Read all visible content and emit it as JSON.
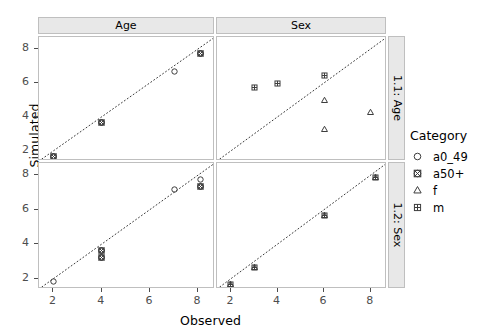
{
  "chart_data": {
    "type": "scatter",
    "title": "",
    "xlabel": "Observed",
    "ylabel": "Simulated",
    "xlim": [
      1.4,
      8.7
    ],
    "ylim": [
      1.4,
      8.7
    ],
    "xticks": [
      "2",
      "4",
      "6",
      "8"
    ],
    "yticks": [
      "2",
      "4",
      "6",
      "8"
    ],
    "xtick_values": [
      2,
      4,
      6,
      8
    ],
    "ytick_values": [
      2,
      4,
      6,
      8
    ],
    "grid": false,
    "legend_position": "right",
    "legend_title": "Category",
    "reference_line": {
      "type": "identity",
      "style": "dotted",
      "color": "#3a3a3a",
      "from": [
        1.4,
        1.4
      ],
      "to": [
        8.7,
        8.7
      ]
    },
    "facet_cols": [
      "Age",
      "Sex"
    ],
    "facet_rows": [
      "1.1: Age",
      "1.2: Sex"
    ],
    "categories": [
      "a0_49",
      "a50+",
      "f",
      "m"
    ],
    "category_glyphs": [
      "open-circle",
      "circled-cross",
      "open-triangle",
      "dotted-square"
    ],
    "panels": [
      {
        "row": "1.1: Age",
        "col": "Age",
        "points": [
          {
            "category": "a0_49",
            "x": 2.0,
            "y": 2.0
          },
          {
            "category": "a50+",
            "x": 2.0,
            "y": 2.0
          },
          {
            "category": "a0_49",
            "x": 4.0,
            "y": 4.0
          },
          {
            "category": "a50+",
            "x": 4.0,
            "y": 4.0
          },
          {
            "category": "a0_49",
            "x": 7.0,
            "y": 7.0
          },
          {
            "category": "a0_49",
            "x": 8.1,
            "y": 8.1
          },
          {
            "category": "a50+",
            "x": 8.1,
            "y": 8.1
          }
        ]
      },
      {
        "row": "1.1: Age",
        "col": "Sex",
        "points": [
          {
            "category": "m",
            "x": 3.0,
            "y": 6.1
          },
          {
            "category": "m",
            "x": 4.0,
            "y": 6.3
          },
          {
            "category": "m",
            "x": 6.0,
            "y": 6.8
          },
          {
            "category": "f",
            "x": 6.0,
            "y": 5.3
          },
          {
            "category": "f",
            "x": 6.0,
            "y": 3.6
          },
          {
            "category": "f",
            "x": 8.0,
            "y": 4.6
          }
        ]
      },
      {
        "row": "1.2: Sex",
        "col": "Age",
        "points": [
          {
            "category": "a0_49",
            "x": 2.0,
            "y": 2.2
          },
          {
            "category": "a0_49",
            "x": 4.0,
            "y": 4.0
          },
          {
            "category": "a50+",
            "x": 4.0,
            "y": 4.0
          },
          {
            "category": "a0_49",
            "x": 4.0,
            "y": 3.6
          },
          {
            "category": "a50+",
            "x": 4.0,
            "y": 3.6
          },
          {
            "category": "a0_49",
            "x": 7.0,
            "y": 7.5
          },
          {
            "category": "a0_49",
            "x": 8.1,
            "y": 8.1
          },
          {
            "category": "a0_49",
            "x": 8.1,
            "y": 7.7
          },
          {
            "category": "a50+",
            "x": 8.1,
            "y": 7.7
          }
        ]
      },
      {
        "row": "1.2: Sex",
        "col": "Sex",
        "points": [
          {
            "category": "f",
            "x": 2.0,
            "y": 2.0
          },
          {
            "category": "m",
            "x": 2.0,
            "y": 2.0
          },
          {
            "category": "f",
            "x": 3.0,
            "y": 3.0
          },
          {
            "category": "m",
            "x": 3.0,
            "y": 3.0
          },
          {
            "category": "f",
            "x": 6.0,
            "y": 6.0
          },
          {
            "category": "m",
            "x": 6.0,
            "y": 6.0
          },
          {
            "category": "f",
            "x": 8.2,
            "y": 8.2
          },
          {
            "category": "m",
            "x": 8.2,
            "y": 8.2
          }
        ]
      }
    ]
  },
  "axes": {
    "ylabel": "Simulated",
    "xlabel": "Observed"
  },
  "strips": {
    "columns": [
      {
        "label": "Age"
      },
      {
        "label": "Sex"
      }
    ],
    "rows": [
      {
        "label": "1.1: Age"
      },
      {
        "label": "1.2: Sex"
      }
    ]
  },
  "legend": {
    "title": "Category",
    "items": [
      {
        "label": "a0_49",
        "glyph": "open-circle"
      },
      {
        "label": "a50+",
        "glyph": "circled-cross"
      },
      {
        "label": "f",
        "glyph": "open-triangle"
      },
      {
        "label": "m",
        "glyph": "dotted-square"
      }
    ]
  },
  "colors": {
    "point": "#3d3d3d",
    "refline": "#3a3a3a",
    "strip_bg": "#e8e8e8",
    "panel_border": "#bfbfbf",
    "tick": "#4d4d4d",
    "background": "#ffffff"
  },
  "ticks": {
    "y_top": [
      "8",
      "6",
      "4",
      "2"
    ],
    "y_bottom": [
      "8",
      "6",
      "4",
      "2"
    ],
    "x_left": [
      "2",
      "4",
      "6",
      "8"
    ],
    "x_right": [
      "2",
      "4",
      "6",
      "8"
    ]
  }
}
